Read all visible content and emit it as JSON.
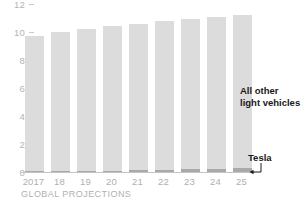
{
  "chart_data": {
    "type": "bar",
    "stacked": true,
    "title": "",
    "subtitle": "",
    "xlabel": "GLOBAL PROJECTIONS",
    "ylabel": "",
    "ylim": [
      0,
      12
    ],
    "yticks": [
      12,
      10,
      8,
      6,
      4,
      2,
      0
    ],
    "grid": false,
    "legend_position": "annotation-right",
    "categories": [
      "2017",
      "18",
      "19",
      "20",
      "21",
      "22",
      "23",
      "24",
      "25"
    ],
    "series": [
      {
        "name": "Tesla",
        "color": "#a9a9a9",
        "values": [
          0.05,
          0.06,
          0.07,
          0.08,
          0.12,
          0.15,
          0.2,
          0.25,
          0.3
        ]
      },
      {
        "name": "All other light vehicles",
        "color": "#dcdcdc",
        "values": [
          9.65,
          9.94,
          10.13,
          10.32,
          10.48,
          10.65,
          10.7,
          10.85,
          10.9
        ]
      }
    ],
    "totals": [
      9.7,
      10.0,
      10.2,
      10.4,
      10.6,
      10.8,
      10.9,
      11.1,
      11.2
    ],
    "annotations": [
      {
        "name": "all-other-light-vehicles",
        "text_line1": "All other",
        "text_line2": "light vehicles"
      },
      {
        "name": "tesla",
        "text": "Tesla"
      }
    ]
  },
  "axis": {
    "ticks": [
      {
        "label": "12"
      },
      {
        "label": "10"
      },
      {
        "label": "8"
      },
      {
        "label": "6"
      },
      {
        "label": "4"
      },
      {
        "label": "2"
      },
      {
        "label": "0"
      }
    ],
    "caption": "GLOBAL PROJECTIONS"
  },
  "labels": {
    "all_other_line1": "All other",
    "all_other_line2": "light vehicles",
    "tesla": "Tesla"
  },
  "colors": {
    "bar_main": "#dcdcdc",
    "bar_tesla": "#a9a9a9",
    "tick_text": "#b4b4b4",
    "annotation_text": "#1a1a1a",
    "axis_line": "#c4c4c4",
    "background": "#ffffff"
  }
}
